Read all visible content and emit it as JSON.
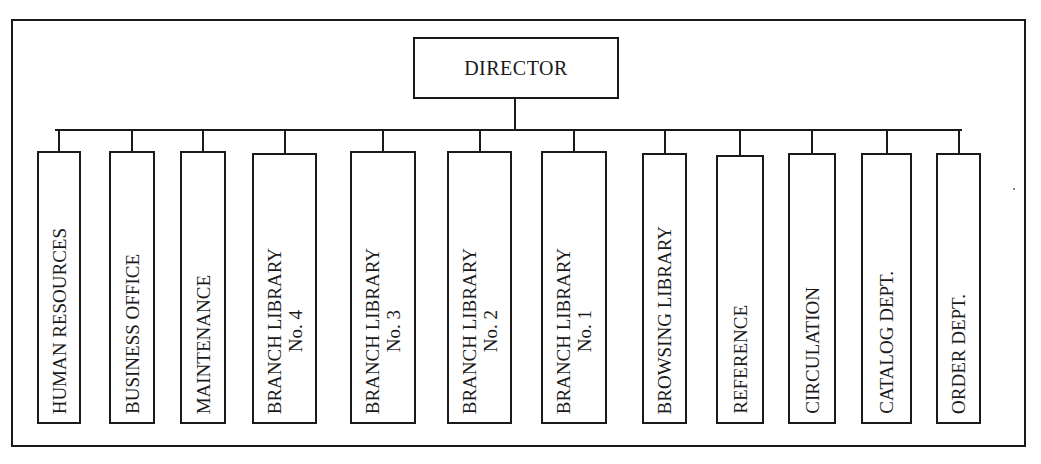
{
  "diagram": {
    "type": "org-chart",
    "root": {
      "label": "DIRECTOR"
    },
    "children": [
      {
        "line1": "HUMAN RESOURCES",
        "line2": ""
      },
      {
        "line1": "BUSINESS OFFICE",
        "line2": ""
      },
      {
        "line1": "MAINTENANCE",
        "line2": ""
      },
      {
        "line1": "BRANCH LIBRARY",
        "line2": "No. 4"
      },
      {
        "line1": "BRANCH LIBRARY",
        "line2": "No. 3"
      },
      {
        "line1": "BRANCH LIBRARY",
        "line2": "No. 2"
      },
      {
        "line1": "BRANCH LIBRARY",
        "line2": "No. 1"
      },
      {
        "line1": "BROWSING LIBRARY",
        "line2": ""
      },
      {
        "line1": "REFERENCE",
        "line2": ""
      },
      {
        "line1": "CIRCULATION",
        "line2": ""
      },
      {
        "line1": "CATALOG DEPT.",
        "line2": ""
      },
      {
        "line1": "ORDER DEPT.",
        "line2": ""
      }
    ],
    "colors": {
      "stroke": "#1a1a1a",
      "background": "#ffffff"
    }
  }
}
